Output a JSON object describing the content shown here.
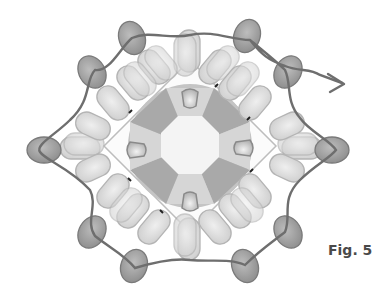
{
  "figure": {
    "label": "Fig. 5",
    "colors": {
      "background": "#ffffff",
      "thread": "#6e6e6e",
      "pill_bead_fill": "#dcdcdc",
      "pill_bead_stroke": "#b4b4b4",
      "accent_bead_fill": "#9a9a9a",
      "accent_bead_stroke": "#7a7a7a",
      "rivoli_outer": "#c2c2c2",
      "rivoli_dark_facet": "#a9a9a9",
      "rivoli_light_facet": "#d9d9d9",
      "rivoli_center": "#f4f4f4",
      "label": "#4a4a4a"
    },
    "components": {
      "rivoli": "center square stone with octagonal facet pattern",
      "spike_markers": [
        "top",
        "right",
        "bottom",
        "left"
      ],
      "thread_exit_arrow": "right"
    }
  }
}
